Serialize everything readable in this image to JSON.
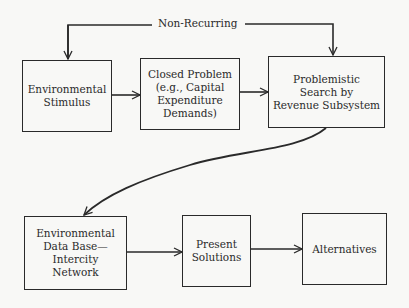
{
  "diagram": {
    "type": "flowchart",
    "feedback_label": "Non-Recurring",
    "nodes": [
      {
        "id": "environmental-stimulus",
        "lines": [
          "Environmental",
          "Stimulus"
        ]
      },
      {
        "id": "closed-problem",
        "lines": [
          "Closed Problem",
          "(e.g., Capital",
          "Expenditure",
          "Demands)"
        ]
      },
      {
        "id": "problemistic-search",
        "lines": [
          "Problemistic",
          "Search by",
          "Revenue Subsystem"
        ]
      },
      {
        "id": "environmental-data-base",
        "lines": [
          "Environmental",
          "Data Base—",
          "Intercity",
          "Network"
        ]
      },
      {
        "id": "present-solutions",
        "lines": [
          "Present",
          "Solutions"
        ]
      },
      {
        "id": "alternatives",
        "lines": [
          "Alternatives"
        ]
      }
    ],
    "edges": [
      {
        "from": "environmental-stimulus",
        "to": "closed-problem"
      },
      {
        "from": "closed-problem",
        "to": "problemistic-search"
      },
      {
        "from": "problemistic-search",
        "to": "environmental-data-base",
        "style": "curved"
      },
      {
        "from": "environmental-data-base",
        "to": "present-solutions"
      },
      {
        "from": "present-solutions",
        "to": "alternatives"
      },
      {
        "from": "non-recurring",
        "to": "environmental-stimulus",
        "label": "Non-Recurring"
      },
      {
        "from": "non-recurring",
        "to": "problemistic-search",
        "label": "Non-Recurring"
      }
    ]
  },
  "colors": {
    "line": "#2a2a2a",
    "background": "#f8f8f6"
  }
}
